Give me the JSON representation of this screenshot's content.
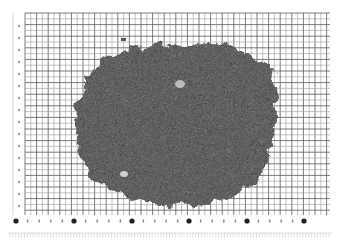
{
  "image": {
    "description": "Grayscale photograph of a pile of shredded granular material spread on graph paper with a measurement ruler",
    "background_color": "#ffffff",
    "grid_color": "#8a8a8a",
    "grid_major_color": "#5a5a5a",
    "material_color": "#4a4a4a",
    "ruler_dot_color": "#222222"
  },
  "grid": {
    "left": 25,
    "top": 13,
    "right": 330,
    "bottom": 215,
    "minor_spacing": 5.8,
    "major_every": 2
  },
  "ruler": {
    "y": 221,
    "dots_x": [
      16,
      74,
      132,
      189,
      247,
      304
    ],
    "tick_row_y": 233
  },
  "left_scale": {
    "x": 19,
    "marks_y": [
      26,
      38,
      50,
      62,
      74,
      86,
      98,
      110,
      122,
      134,
      146,
      158,
      170,
      182,
      194,
      206
    ]
  },
  "material_pile": {
    "center_x": 180,
    "center_y": 120,
    "approx_bounds": {
      "left": 75,
      "top": 40,
      "right": 278,
      "bottom": 205
    }
  }
}
